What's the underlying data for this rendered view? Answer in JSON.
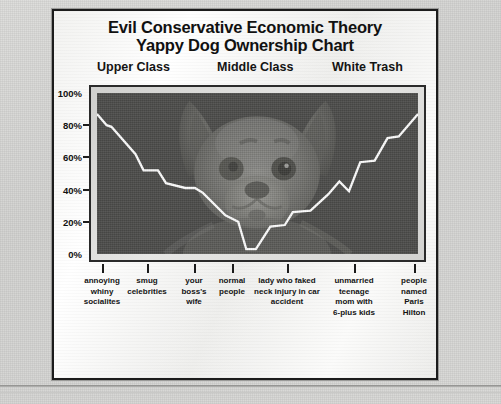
{
  "chart_data": {
    "type": "line",
    "title": "Evil Conservative Economic Theory Yappy Dog Ownership Chart",
    "title_lines": [
      "Evil Conservative Economic Theory",
      "Yappy Dog Ownership Chart"
    ],
    "xlabel": "",
    "ylabel": "",
    "ylim": [
      0,
      100
    ],
    "ytick_labels": [
      "100%",
      "80%",
      "60%",
      "40%",
      "20%",
      "0%"
    ],
    "ytick_values": [
      100,
      80,
      60,
      40,
      20,
      0
    ],
    "grid": false,
    "legend": "none",
    "group_headers": [
      "Upper Class",
      "Middle Class",
      "White Trash"
    ],
    "categories": [
      "annoying whiny socialites",
      "smug celebrities",
      "your boss's wife",
      "normal people",
      "lady who faked neck injury in car accident",
      "unmarried teenage mom with 6-plus kids",
      "people named Paris Hilton"
    ],
    "category_lines": [
      [
        "annoying",
        "whiny",
        "socialites"
      ],
      [
        "smug",
        "celebrities"
      ],
      [
        "your",
        "boss's",
        "wife"
      ],
      [
        "normal",
        "people"
      ],
      [
        "lady who faked",
        "neck injury in car",
        "accident"
      ],
      [
        "unmarried",
        "teenage",
        "mom with",
        "6-plus kids"
      ],
      [
        "people",
        "named",
        "Paris",
        "Hilton"
      ]
    ],
    "values": [
      87,
      52,
      38,
      3,
      30,
      57,
      87
    ],
    "series": [
      {
        "name": "Yappy dog ownership",
        "values": [
          87,
          52,
          38,
          3,
          30,
          57,
          87
        ],
        "color": "#ffffff"
      }
    ],
    "step_points": [
      {
        "x": 0.0,
        "y": 87
      },
      {
        "x": 3.0,
        "y": 80
      },
      {
        "x": 4.5,
        "y": 79
      },
      {
        "x": 12.0,
        "y": 62
      },
      {
        "x": 14.5,
        "y": 52
      },
      {
        "x": 19.0,
        "y": 52
      },
      {
        "x": 21.5,
        "y": 44
      },
      {
        "x": 27.5,
        "y": 41
      },
      {
        "x": 30.5,
        "y": 41
      },
      {
        "x": 33.0,
        "y": 38
      },
      {
        "x": 40.0,
        "y": 24
      },
      {
        "x": 44.0,
        "y": 20
      },
      {
        "x": 46.5,
        "y": 3
      },
      {
        "x": 49.5,
        "y": 3
      },
      {
        "x": 54.0,
        "y": 17
      },
      {
        "x": 58.5,
        "y": 18
      },
      {
        "x": 61.0,
        "y": 26
      },
      {
        "x": 66.5,
        "y": 27
      },
      {
        "x": 72.0,
        "y": 37
      },
      {
        "x": 75.5,
        "y": 45
      },
      {
        "x": 78.5,
        "y": 39
      },
      {
        "x": 82.0,
        "y": 57
      },
      {
        "x": 86.5,
        "y": 58
      },
      {
        "x": 90.5,
        "y": 72
      },
      {
        "x": 94.0,
        "y": 73
      },
      {
        "x": 97.0,
        "y": 80
      },
      {
        "x": 100.0,
        "y": 87
      }
    ],
    "line_color": "#ffffff",
    "plot_background": "#4a4a4a",
    "watermark": "chihuahua-dog-face"
  },
  "colors": {
    "page_background": "#d6d6d4",
    "card_background": "#f4f4f2",
    "border": "#1c1c1c",
    "text": "#111111",
    "line": "#ffffff",
    "plot_fill": "#4a4a4a"
  }
}
